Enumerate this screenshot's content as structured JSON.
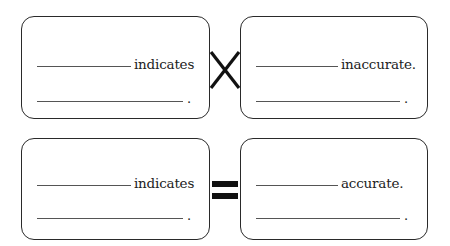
{
  "rows": [
    {
      "left_box": {
        "word": "indicates",
        "end_punct": "."
      },
      "connector": "cross-icon",
      "right_box": {
        "word": "inaccurate.",
        "end_punct": "."
      }
    },
    {
      "left_box": {
        "word": "indicates",
        "end_punct": "."
      },
      "connector": "equals-icon",
      "right_box": {
        "word": "accurate.",
        "end_punct": "."
      }
    }
  ],
  "colors": {
    "stroke": "#2a2a2a",
    "blank_line": "#555555",
    "symbol": "#111111"
  }
}
